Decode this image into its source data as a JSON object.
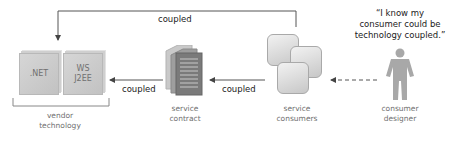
{
  "diagram": {
    "nodes": {
      "vendor_technology": {
        "label_line1": "vendor",
        "label_line2": "technology",
        "boxes": [
          ".NET",
          "WS\nJ2EE"
        ]
      },
      "service_contract": {
        "label_line1": "service",
        "label_line2": "contract"
      },
      "service_consumers": {
        "label_line1": "service",
        "label_line2": "consumers"
      },
      "consumer_designer": {
        "label_line1": "consumer",
        "label_line2": "designer"
      }
    },
    "edges": [
      {
        "from": "service_consumers",
        "to": "vendor_technology",
        "label": "coupled",
        "style": "solid"
      },
      {
        "from": "service_contract",
        "to": "vendor_technology",
        "label": "coupled",
        "style": "solid"
      },
      {
        "from": "service_consumers",
        "to": "service_contract",
        "label": "coupled",
        "style": "solid"
      },
      {
        "from": "consumer_designer",
        "to": "service_consumers",
        "label": "",
        "style": "dashed"
      }
    ],
    "quote": {
      "line1": "“I know my",
      "line2": "consumer could be",
      "line3": "technology coupled.”"
    }
  },
  "colors": {
    "line": "#555555",
    "label_text": "#6f6f6f",
    "edge_text": "#222222"
  }
}
